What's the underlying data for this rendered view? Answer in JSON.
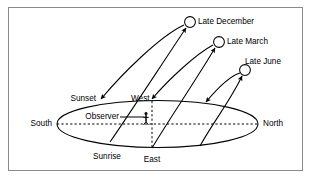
{
  "figure": {
    "frame_color": "#808080",
    "background_color": "#ffffff",
    "line_color": "#000000",
    "width": 311,
    "height": 179
  },
  "labels": {
    "late_december": "Late December",
    "late_march": "Late March",
    "late_june": "Late June",
    "sunset": "Sunset",
    "sunrise": "Sunrise",
    "west": "West",
    "east": "East",
    "south": "South",
    "north": "North",
    "observer": "Observer"
  },
  "diagram_data": {
    "type": "diagram",
    "horizon": {
      "shape": "ellipse",
      "center": [
        157.5,
        124
      ],
      "radius_x": 100.5,
      "radius_y": 23.5,
      "axis_style": "dashed",
      "axis_endpoints": [
        "South",
        "North"
      ]
    },
    "cardinal_points": [
      {
        "name": "South",
        "x": 57,
        "y": 124
      },
      {
        "name": "North",
        "x": 258,
        "y": 124
      },
      {
        "name": "West",
        "x": 152,
        "y": 101
      },
      {
        "name": "East",
        "x": 152,
        "y": 148
      }
    ],
    "observer": {
      "x": 146,
      "y": 124,
      "marker": "stick-figure"
    },
    "sun_positions": [
      {
        "name": "Late December",
        "x": 190,
        "y": 22,
        "radius": 5.5
      },
      {
        "name": "Late March",
        "x": 219,
        "y": 42,
        "radius": 5.5
      },
      {
        "name": "Late June",
        "x": 245,
        "y": 70,
        "radius": 5.5
      }
    ],
    "sun_paths": [
      {
        "name": "Late December",
        "rise_point": [
          110,
          142
        ],
        "set_point": [
          102,
          101
        ],
        "peak": [
          190,
          22
        ]
      },
      {
        "name": "Late March",
        "rise_point": [
          152,
          148
        ],
        "set_point": [
          152,
          101
        ],
        "peak": [
          219,
          42
        ]
      },
      {
        "name": "Late June",
        "rise_point": [
          200,
          146
        ],
        "set_point": [
          205,
          104
        ],
        "peak": [
          245,
          70
        ]
      }
    ]
  }
}
